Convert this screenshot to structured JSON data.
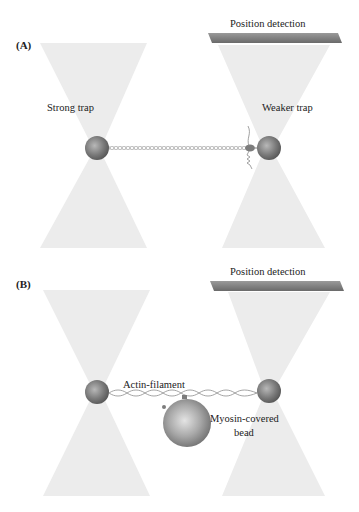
{
  "panels": [
    {
      "id": "A",
      "label": "(A)",
      "detector_label": "Position detection",
      "left_trap_label": "Strong trap",
      "right_trap_label": "Weaker trap"
    },
    {
      "id": "B",
      "label": "(B)",
      "detector_label": "Position detection",
      "filament_label": "Actin-filament",
      "bead_label_line1": "Myosin-covered",
      "bead_label_line2": "bead"
    }
  ],
  "colors": {
    "beam": "#e9e9e9",
    "bead": "#7a7a7a",
    "detector": "#8a8a8a",
    "filament": "#9a9a9a"
  }
}
